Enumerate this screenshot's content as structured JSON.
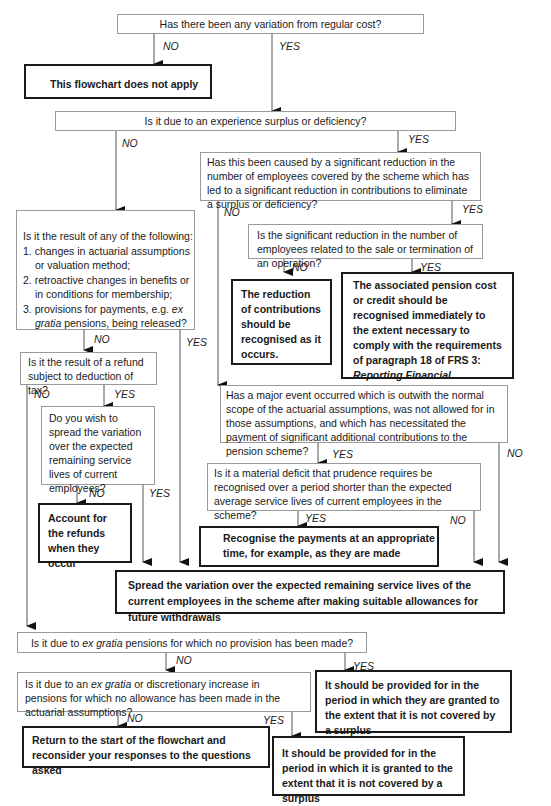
{
  "q1": {
    "text": "Has there been any variation from regular cost?",
    "no": "NO",
    "yes": "YES"
  },
  "end_not_apply": "This flowchart does not apply",
  "q2": {
    "text": "Is it due to an experience surplus or deficiency?",
    "no": "NO",
    "yes": "YES"
  },
  "q3": {
    "text": "Has this been caused by a significant reduction in the number of employees covered by the scheme which has led to a significant reduction in contributions to eliminate a surplus or deficiency?",
    "no": "NO",
    "yes": "YES"
  },
  "q4": {
    "text": "Is the significant reduction in the number of employees related to the sale or termination of an operation?",
    "no": "NO",
    "yes": "YES"
  },
  "ans_reduction": "The reduction of contributions should be recognised as it occurs.",
  "ans_associated": {
    "pre": "The associated pension cost or credit should be recognised immediately to the extent necessary to comply with the requirements of paragraph 18 of FRS 3: ",
    "italic": "Reporting Financial Performance",
    "post": " - chapter 2."
  },
  "q5": {
    "intro": "Is it the result of any of the following:",
    "items": [
      "1. changes in actuarial assumptions or valuation method;",
      "2. retroactive changes in benefits or in conditions for  membership;"
    ],
    "item3_pre": "3. provisions for payments, e.g. ",
    "item3_italic": "ex gratia",
    "item3_post": " pensions, being released?",
    "no": "NO",
    "yes": "YES"
  },
  "q6": {
    "text": "Is it the result of a refund subject to deduction of tax?",
    "no": "NO",
    "yes": "YES"
  },
  "q7": {
    "text": "Do you wish to spread the variation over the expected remaining service lives of current employees?",
    "no": "NO",
    "yes": "YES"
  },
  "ans_refunds": "Account for the refunds when they occur",
  "q8": {
    "text": "Has a major event occurred which is outwith the normal scope of the actuarial assumptions, was not allowed for in those assumptions, and which has necessitated the payment of significant additional contributions to the pension scheme?",
    "no": "NO",
    "yes": "YES"
  },
  "q9": {
    "text": "Is it a material deficit that prudence requires be recognised over a period shorter than the expected average service lives of current employees in the scheme?",
    "no": "NO",
    "yes": "YES"
  },
  "ans_recognise": "Recognise the payments at an appropriate time, for example, as they are made",
  "ans_spread": "Spread the variation over the expected remaining service lives of the current employees in the scheme after making suitable allowances for future withdrawals",
  "q10": {
    "pre": "Is it due to ",
    "italic": "ex gratia",
    "post": " pensions for which no provision has been made?",
    "no": "NO",
    "yes": "YES"
  },
  "ans_provide_they": "It should be provided for in the period in which they are granted to the extent that it is not covered by a surplus",
  "q11": {
    "pre": "Is it due to an ",
    "italic": "ex gratia",
    "post": " or discretionary increase in pensions for which no allowance has been made in the actuarial assumptions?",
    "no": "NO",
    "yes": "YES"
  },
  "ans_return": "Return to the start of the flowchart and reconsider your responses to the questions asked",
  "ans_provide_it": "It should be provided for in the period in which it is granted to the extent that it is not covered by a surplus"
}
